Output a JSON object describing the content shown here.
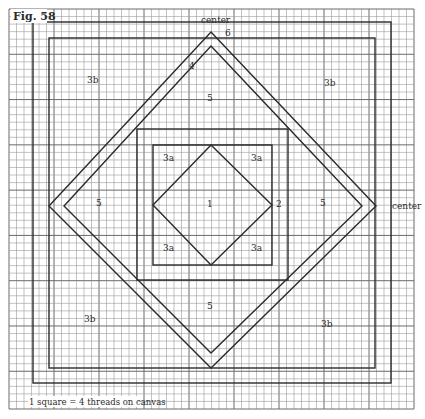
{
  "figure": {
    "title": "Fig. 58",
    "caption": "1 square = 4 threads on canvas",
    "colors": {
      "background": "#ffffff",
      "grid_minor": "#9a9a9a",
      "grid_major": "#6a6a6a",
      "lines": "#2a2a2a",
      "text": "#2b2b2b"
    }
  },
  "grid": {
    "x0": 9,
    "y0": 9,
    "x1": 414,
    "y1": 409,
    "cell": 7.5,
    "major_every": 6
  },
  "labels": {
    "center_top": "center",
    "center_right": "center",
    "region_1": "1",
    "region_2": "2",
    "region_3a_tl": "3a",
    "region_3a_tr": "3a",
    "region_3a_bl": "3a",
    "region_3a_br": "3a",
    "region_3b_tl": "3b",
    "region_3b_tr": "3b",
    "region_3b_bl": "3b",
    "region_3b_br": "3b",
    "region_4": "4",
    "region_5_top": "5",
    "region_5_left": "5",
    "region_5_right": "5",
    "region_5_bottom": "5",
    "region_6": "6"
  },
  "shapes": {
    "outer_square": {
      "x": 33,
      "y": 22,
      "w": 358,
      "h": 361
    },
    "second_square": {
      "x": 49,
      "y": 38,
      "w": 326,
      "h": 330
    },
    "outer_diamond": "211,32 376,206 211,368 49,206",
    "inner_diamond": "211,46 362,206 211,353 64,206",
    "center_outer_square": {
      "x": 137,
      "y": 129,
      "w": 151,
      "h": 151
    },
    "center_inner_square": {
      "x": 153,
      "y": 145,
      "w": 119,
      "h": 120
    },
    "center_diamond": "211,145 272,205 211,265 153,205"
  }
}
